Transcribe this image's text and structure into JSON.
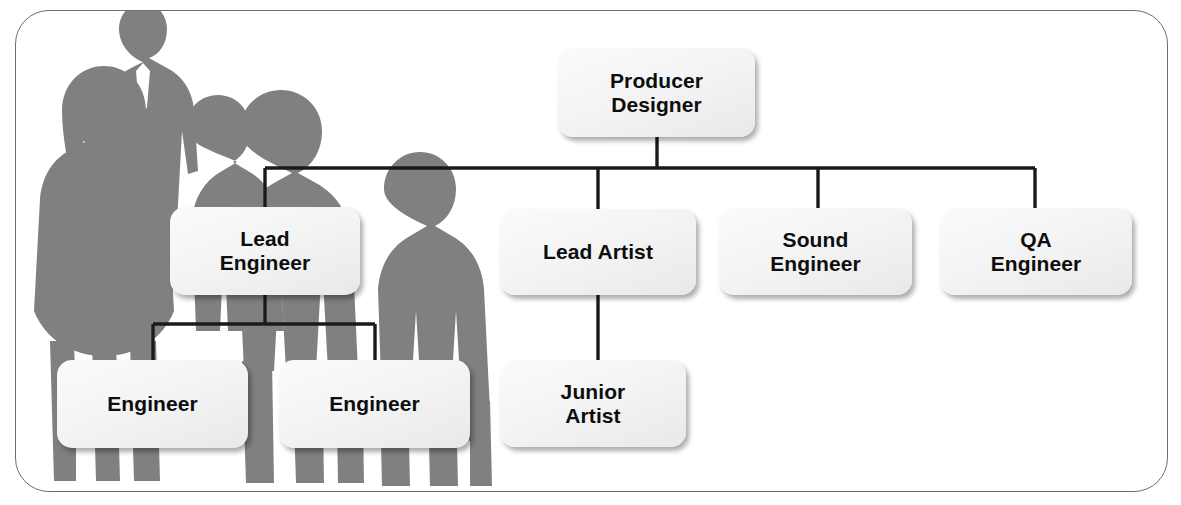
{
  "diagram": {
    "type": "org-chart",
    "frame": {
      "border_color": "#6e6e6e",
      "background_color": "#ffffff",
      "corner_radius": "34px"
    },
    "background_image": {
      "name": "business-team-silhouette",
      "description": "Grey silhouette photograph of four standing business people",
      "color": "#808080"
    },
    "style": {
      "node_fill": "#f4f4f4",
      "node_text_color": "#0d0d0d",
      "connector_color": "#1a1a1a"
    },
    "nodes": [
      {
        "id": "producer-designer",
        "lines": [
          "Producer",
          "Designer"
        ],
        "level": 0,
        "parent": null
      },
      {
        "id": "lead-engineer",
        "lines": [
          "Lead",
          "Engineer"
        ],
        "level": 1,
        "parent": "producer-designer"
      },
      {
        "id": "lead-artist",
        "lines": [
          "Lead Artist"
        ],
        "level": 1,
        "parent": "producer-designer"
      },
      {
        "id": "sound-engineer",
        "lines": [
          "Sound",
          "Engineer"
        ],
        "level": 1,
        "parent": "producer-designer"
      },
      {
        "id": "qa-engineer",
        "lines": [
          "QA",
          "Engineer"
        ],
        "level": 1,
        "parent": "producer-designer"
      },
      {
        "id": "engineer-1",
        "lines": [
          "Engineer"
        ],
        "level": 2,
        "parent": "lead-engineer"
      },
      {
        "id": "engineer-2",
        "lines": [
          "Engineer"
        ],
        "level": 2,
        "parent": "lead-engineer"
      },
      {
        "id": "junior-artist",
        "lines": [
          "Junior",
          "Artist"
        ],
        "level": 2,
        "parent": "lead-artist"
      }
    ]
  }
}
